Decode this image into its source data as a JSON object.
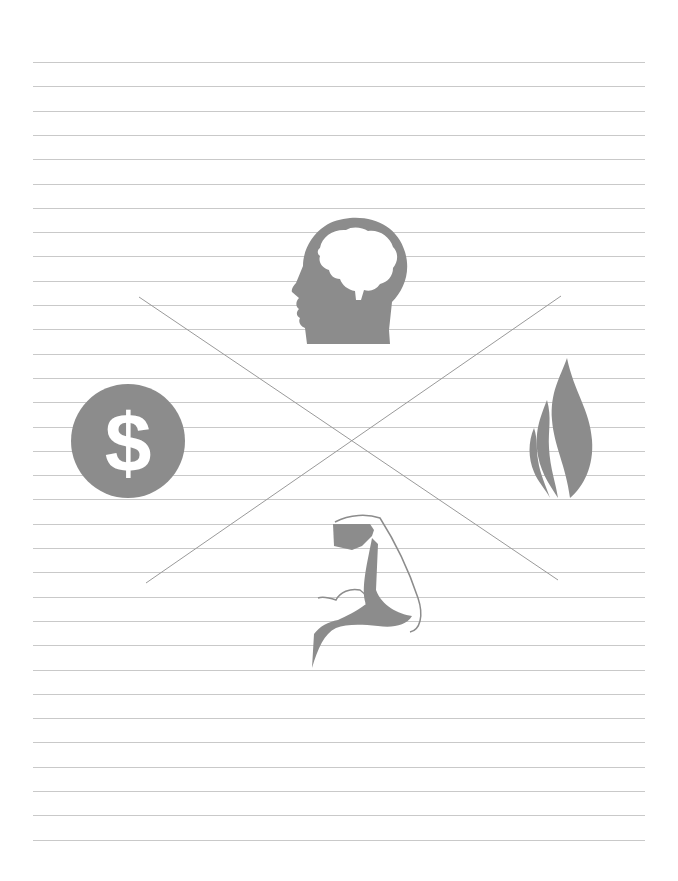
{
  "page": {
    "type": "lined-worksheet",
    "background": "#ffffff",
    "rule_color": "#c9c9c9",
    "rule_count": 33,
    "rule_first_y": 62,
    "rule_spacing": 24.3,
    "rule_left": 33,
    "rule_right": 645
  },
  "diagram": {
    "line_color": "#9a9a9a",
    "icon_color": "#8c8c8c",
    "cross_lines": [
      {
        "x1": 139,
        "y1": 297,
        "x2": 558,
        "y2": 580
      },
      {
        "x1": 146,
        "y1": 583,
        "x2": 561,
        "y2": 296
      }
    ],
    "quadrants": [
      {
        "position": "top",
        "icon": "brain-head-icon",
        "meaning": "mind"
      },
      {
        "position": "left",
        "icon": "dollar-coin-icon",
        "meaning": "money"
      },
      {
        "position": "right",
        "icon": "flame-icon",
        "meaning": "spirit"
      },
      {
        "position": "bottom",
        "icon": "flexed-arm-icon",
        "meaning": "body"
      }
    ],
    "dollar_symbol": "$"
  }
}
